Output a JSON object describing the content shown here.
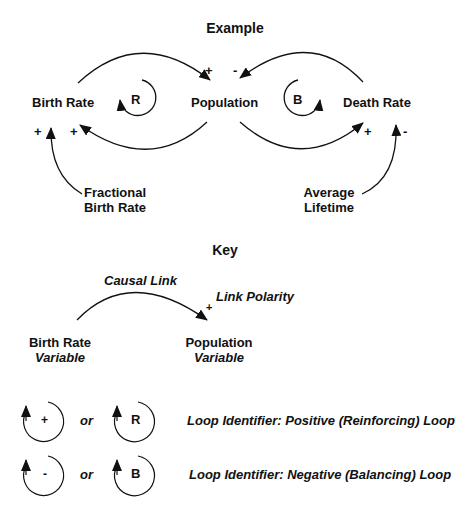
{
  "example": {
    "title": "Example",
    "variables": {
      "birth_rate": "Birth Rate",
      "population": "Population",
      "death_rate": "Death Rate",
      "fractional_birth_rate_line1": "Fractional",
      "fractional_birth_rate_line2": "Birth Rate",
      "average_lifetime_line1": "Average",
      "average_lifetime_line2": "Lifetime"
    },
    "loops": {
      "reinforcing": "R",
      "balancing": "B"
    },
    "polarities": {
      "birth_to_population": "+",
      "death_to_population": "-",
      "fractional_to_birth": "+",
      "population_to_birth": "+",
      "population_to_death": "+",
      "lifetime_to_death": "-"
    }
  },
  "key": {
    "title": "Key",
    "causal_link_label": "Causal Link",
    "link_polarity_label": "Link Polarity",
    "link_polarity_sign": "+",
    "var1_name": "Birth Rate",
    "var1_type": "Variable",
    "var2_name": "Population",
    "var2_type": "Variable",
    "loop_identifiers": [
      {
        "symbol": "+",
        "or": "or",
        "letter": "R",
        "description": "Loop Identifier: Positive (Reinforcing) Loop"
      },
      {
        "symbol": "-",
        "or": "or",
        "letter": "B",
        "description": "Loop Identifier: Negative (Balancing) Loop"
      }
    ]
  }
}
